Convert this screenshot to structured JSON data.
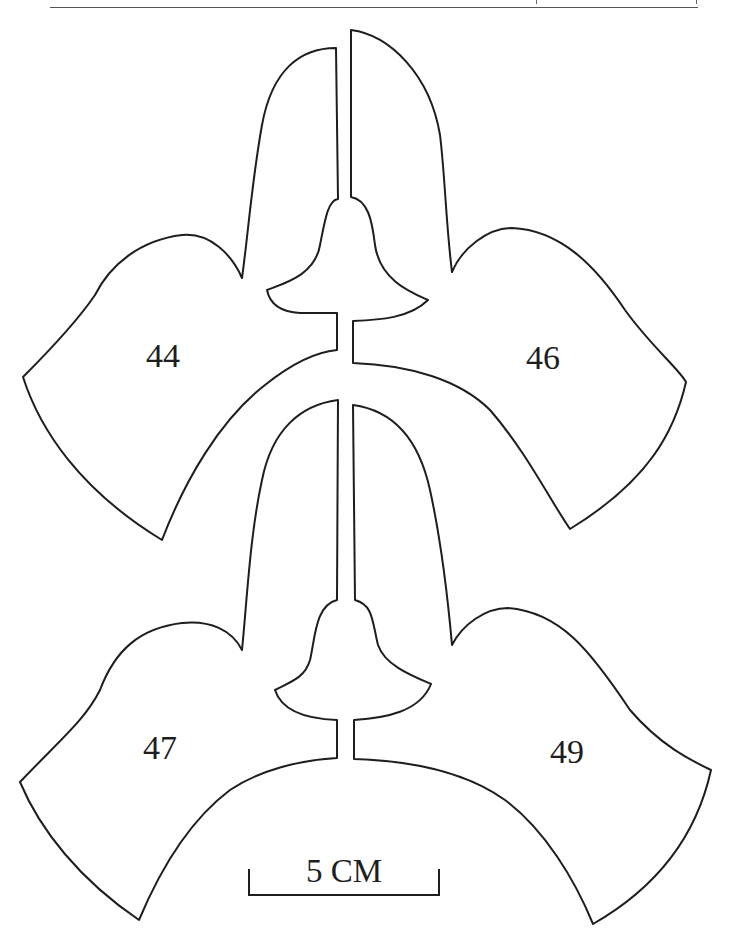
{
  "figure": {
    "type": "specimen outline diagram",
    "pieces": [
      {
        "id": "44",
        "label": "44",
        "position": "upper-left"
      },
      {
        "id": "46",
        "label": "46",
        "position": "upper-right"
      },
      {
        "id": "47",
        "label": "47",
        "position": "lower-left"
      },
      {
        "id": "49",
        "label": "49",
        "position": "lower-right"
      }
    ],
    "scale_bar": {
      "label": "5 CM",
      "length_px": 192
    },
    "colors": {
      "stroke": "#1e1e1e",
      "background": "#ffffff",
      "rule": "#555555"
    }
  }
}
